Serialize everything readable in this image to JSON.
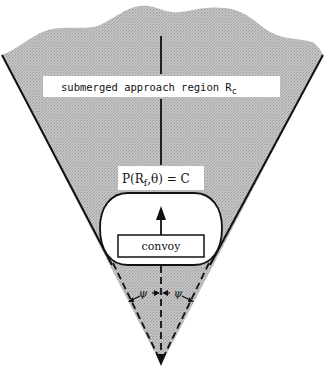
{
  "diagram": {
    "region_label": {
      "text": "submerged approach region R",
      "subscript": "c"
    },
    "probability_label": {
      "prefix": "P(R",
      "subscript": "f",
      "suffix": ",θ) = C"
    },
    "convoy_label": "convoy",
    "angle_left_label": "ψ",
    "angle_right_label": "ψ",
    "colors": {
      "region_fill": "#bdbdbd",
      "line": "#111111",
      "label_bg": "#ffffff"
    }
  }
}
